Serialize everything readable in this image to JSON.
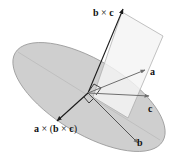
{
  "figure": {
    "colors": {
      "ellipse_fill": "#cfcfcf",
      "ellipse_stroke": "#9a9a9a",
      "plane_fill": "#f4f4f4",
      "plane_stroke": "#a8a8a8",
      "dark_vector": "#1a1a1a",
      "gray_vector": "#6e6e6e",
      "label": "#111111"
    },
    "vectors": [
      {
        "id": "bxc",
        "label": "b × c",
        "label_parts": [
          "b",
          " × ",
          "c"
        ]
      },
      {
        "id": "a",
        "label": "a"
      },
      {
        "id": "c",
        "label": "c"
      },
      {
        "id": "b",
        "label": "b"
      },
      {
        "id": "axbxc",
        "label": "a × (b × c)",
        "label_parts": [
          "a",
          " × (",
          "b",
          " × ",
          "c",
          ")"
        ]
      }
    ]
  }
}
